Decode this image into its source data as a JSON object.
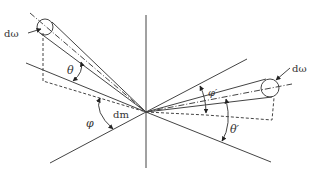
{
  "diagram": {
    "colors": {
      "stroke": "#444444",
      "background": "#ffffff"
    },
    "labels": {
      "d_omega_left": "dω",
      "d_omega_right": "dω",
      "theta": "θ",
      "theta_prime": "θ′",
      "phi": "φ",
      "phi_prime": "φ′",
      "dm": "dm"
    },
    "center": [
      146,
      112
    ],
    "elements": [
      "vertical normal axis",
      "surface plane lines",
      "incident beam cone with solid angle dω",
      "scattered beam cone with solid angle dω",
      "angle arcs θ, φ, θ′, φ′",
      "dashed projection lines"
    ]
  }
}
